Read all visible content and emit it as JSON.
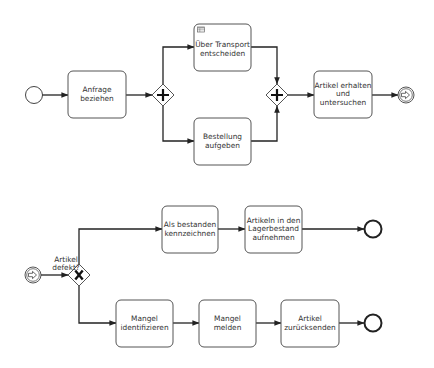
{
  "diagram": {
    "type": "BPMN process diagrams",
    "colors": {
      "stroke": "#222222",
      "task_border": "#555555",
      "text": "#333333",
      "background": "#ffffff"
    },
    "process_1": {
      "start_event": {
        "type": "none-start"
      },
      "tasks": [
        {
          "id": "t1",
          "label": "Anfrage beziehen",
          "lines": [
            "Anfrage",
            "beziehen"
          ]
        },
        {
          "id": "t2",
          "label": "Über Transport entscheiden",
          "lines": [
            "Über Transport",
            "entscheiden"
          ],
          "marker": "business-rule-table-icon"
        },
        {
          "id": "t3",
          "label": "Bestellung aufgeben",
          "lines": [
            "Bestellung",
            "aufgeben"
          ]
        },
        {
          "id": "t4",
          "label": "Artikel erhalten und untersuchen",
          "lines": [
            "Artikel erhalten",
            "und",
            "untersuchen"
          ]
        }
      ],
      "gateways": [
        {
          "id": "g1",
          "type": "parallel-split",
          "symbol": "+"
        },
        {
          "id": "g2",
          "type": "parallel-join",
          "symbol": "+"
        }
      ],
      "end_event": {
        "type": "message-end"
      }
    },
    "process_2": {
      "start_event": {
        "type": "message-start"
      },
      "gateway": {
        "type": "exclusive",
        "symbol": "X",
        "label": "Artikel defekt?",
        "lines": [
          "Artikel",
          "defekt?"
        ]
      },
      "upper_branch": [
        {
          "id": "u1",
          "label": "Als bestanden kennzeichnen",
          "lines": [
            "Als bestanden",
            "kennzeichnen"
          ]
        },
        {
          "id": "u2",
          "label": "Artikeln in den Lagerbestand aufnehmen",
          "lines": [
            "Artikeln in den",
            "Lagerbestand",
            "aufnehmen"
          ]
        }
      ],
      "lower_branch": [
        {
          "id": "l1",
          "label": "Mangel identifizieren",
          "lines": [
            "Mangel",
            "identifizieren"
          ]
        },
        {
          "id": "l2",
          "label": "Mangel melden",
          "lines": [
            "Mangel",
            "melden"
          ]
        },
        {
          "id": "l3",
          "label": "Artikel zurücksenden",
          "lines": [
            "Artikel",
            "zurücksenden"
          ]
        }
      ],
      "end_events": [
        {
          "type": "none-end"
        },
        {
          "type": "none-end"
        }
      ]
    }
  }
}
